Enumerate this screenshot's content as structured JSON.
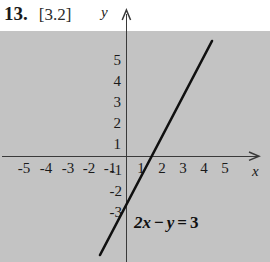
{
  "problem": {
    "number": "13.",
    "section": "[3.2]"
  },
  "chart_data": {
    "type": "line",
    "title": "",
    "xlabel": "x",
    "ylabel": "y",
    "equation": {
      "coef_x": "2x",
      "operator": "−",
      "var_y": "y",
      "equals": "=",
      "rhs": "3",
      "full": "2x − y = 3"
    },
    "line": {
      "slope": 2,
      "intercept": -3,
      "x_intercept": 1.5,
      "y_intercept": -3,
      "points": [
        [
          -0.2,
          -3.4
        ],
        [
          4.1,
          5.2
        ]
      ]
    },
    "xlim": [
      -6,
      6.2
    ],
    "ylim": [
      -5,
      5.8
    ],
    "grid": true,
    "legend": "none",
    "x_ticks": [
      "-5",
      "-4",
      "-3",
      "-2",
      "-1",
      "1",
      "2",
      "3",
      "4",
      "5"
    ],
    "y_ticks": [
      "5",
      "4",
      "3",
      "2",
      "1",
      "-1",
      "-2",
      "-3"
    ],
    "axis_arrow_x": "x-axis-arrow",
    "axis_arrow_y": "y-axis-arrow"
  },
  "ticks": {
    "x_negative": [
      {
        "label": "-5",
        "x": 14
      },
      {
        "label": "-4",
        "x": 36
      },
      {
        "label": "-3",
        "x": 58
      },
      {
        "label": "-2",
        "x": 79
      },
      {
        "label": "-1",
        "x": 100
      }
    ],
    "x_positive": [
      {
        "label": "1",
        "x": 131
      },
      {
        "label": "2",
        "x": 152
      },
      {
        "label": "3",
        "x": 173
      },
      {
        "label": "4",
        "x": 194
      },
      {
        "label": "5",
        "x": 215
      }
    ],
    "y_positive": [
      {
        "label": "5",
        "y": 52
      },
      {
        "label": "4",
        "y": 73
      },
      {
        "label": "3",
        "y": 94
      },
      {
        "label": "2",
        "y": 115
      },
      {
        "label": "1",
        "y": 136
      }
    ],
    "y_negative": [
      {
        "label": "-1",
        "y": 162
      },
      {
        "label": "-2",
        "y": 183
      },
      {
        "label": "-3",
        "y": 204
      }
    ]
  },
  "colors": {
    "axis": "#3a3a3a",
    "grid": "#b9b9b9",
    "line": "#101010",
    "text": "#1a1a1a",
    "background": "#ffffff"
  }
}
